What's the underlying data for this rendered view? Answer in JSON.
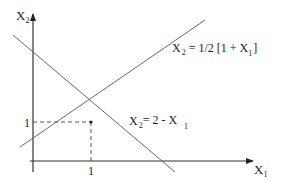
{
  "diagram": {
    "axes": {
      "y_label": "X",
      "y_label_sub": "2",
      "x_label": "X",
      "x_label_sub": "1"
    },
    "ticks": {
      "y_tick_label": "1",
      "x_tick_label": "1"
    },
    "lines": [
      {
        "id": "line-half-one-plus-x1",
        "label_main": "X",
        "label_sub": "2",
        "label_rest": " = 1/2 [1 + X",
        "label_sub2": "1",
        "label_end": "]"
      },
      {
        "id": "line-two-minus-x1",
        "label_main": "X",
        "label_sub": "2",
        "label_rest": "= 2 - X",
        "label_sub2": "1",
        "label_end": ""
      }
    ],
    "intersection": {
      "x1": "1",
      "x2": "1"
    },
    "colors": {
      "axis": "#333333",
      "line": "#666666",
      "dashed": "#555555",
      "text": "#222222"
    }
  }
}
